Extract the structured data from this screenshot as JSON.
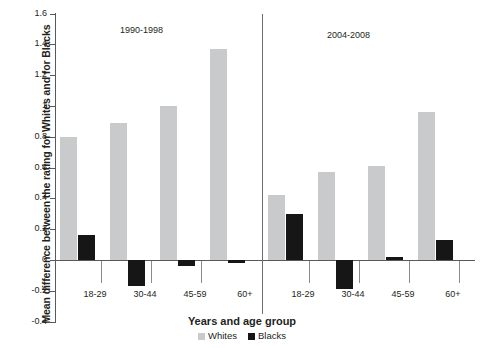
{
  "chart_data": {
    "type": "bar",
    "title": "",
    "xlabel": "Years and age group",
    "ylabel": "Mean difference between the rating for Whites and for Blacks",
    "ylim": [
      -0.4,
      1.6
    ],
    "ytick_values": [
      1.6,
      1.4,
      1.2,
      1,
      0.8,
      0.6,
      0.4,
      0.2,
      0,
      -0.2,
      -0.4
    ],
    "ytick_labels": [
      "1.6",
      "1.4",
      "1.2",
      "1",
      "0.8",
      "0.6",
      "0.4",
      "0.2",
      "0",
      "-0.2",
      "-0.4"
    ],
    "grid": false,
    "legend_position": "bottom-center",
    "panels": [
      {
        "label": "1990-1998",
        "categories": [
          "18-29",
          "30-44",
          "45-59",
          "60+"
        ]
      },
      {
        "label": "2004-2008",
        "categories": [
          "18-29",
          "30-44",
          "45-59",
          "60+"
        ]
      }
    ],
    "categories": [
      "18-29",
      "30-44",
      "45-59",
      "60+",
      "18-29",
      "30-44",
      "45-59",
      "60+"
    ],
    "series": [
      {
        "name": "Whites",
        "color": "#c9cacb",
        "values": [
          0.8,
          0.89,
          1.0,
          1.37,
          0.42,
          0.57,
          0.61,
          0.96
        ]
      },
      {
        "name": "Blacks",
        "color": "#161616",
        "values": [
          0.16,
          -0.17,
          -0.04,
          -0.02,
          0.3,
          -0.19,
          0.02,
          0.13
        ]
      }
    ],
    "legend": [
      "Whites",
      "Blacks"
    ]
  },
  "colors": {
    "whites": "#c9cacb",
    "blacks": "#161616",
    "axis": "#58595b",
    "text": "#231f20",
    "background": "#ffffff"
  }
}
